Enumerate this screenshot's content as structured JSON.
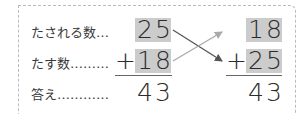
{
  "labels": {
    "augend": "たされる数…",
    "addend": "たす数………",
    "answer": "答え…………"
  },
  "left_problem": {
    "top": "25",
    "operator": "+",
    "bottom": "18",
    "result": "43"
  },
  "right_problem": {
    "top": "18",
    "operator": "+",
    "bottom": "25",
    "result": "43"
  },
  "colors": {
    "shade": "#cccccc",
    "arrow_dark": "#555555",
    "arrow_light": "#aaaaaa",
    "border": "#bbbbbb"
  }
}
